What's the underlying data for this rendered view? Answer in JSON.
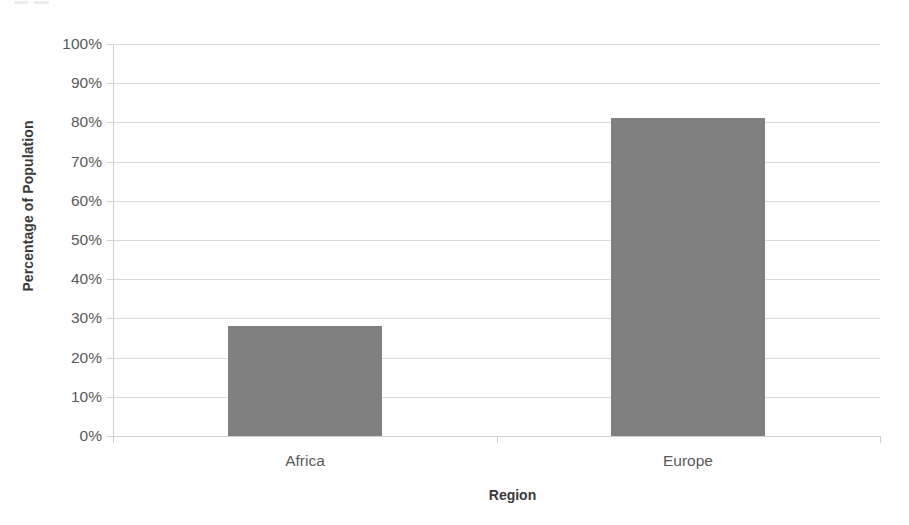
{
  "chart_data": {
    "type": "bar",
    "title": "",
    "subtitle": "",
    "xlabel": "Region",
    "ylabel": "Percentage of Population",
    "categories": [
      "Africa",
      "Europe"
    ],
    "values": [
      28,
      81
    ],
    "series": [
      {
        "name": "Percentage of Population",
        "values": [
          28,
          81
        ],
        "color": "#808080"
      }
    ],
    "ylim": [
      0,
      100
    ],
    "ytick_values": [
      0,
      10,
      20,
      30,
      40,
      50,
      60,
      70,
      80,
      90,
      100
    ],
    "ytick_labels": [
      "0%",
      "10%",
      "20%",
      "30%",
      "40%",
      "50%",
      "60%",
      "70%",
      "80%",
      "90%",
      "100%"
    ],
    "ytick_suffix": "%",
    "grid": true,
    "grid_axis": "y",
    "legend": false,
    "legend_position": "none",
    "bar_color": "#808080",
    "gridline_color": "#d9d9d9",
    "axis_color": "#cfcfcf",
    "background_color": "#ffffff",
    "text_color": "#5a5a5a",
    "title_color": "#3a3a3a",
    "annotations": []
  },
  "axes": {
    "y_title": "Percentage of Population",
    "x_title": "Region"
  }
}
